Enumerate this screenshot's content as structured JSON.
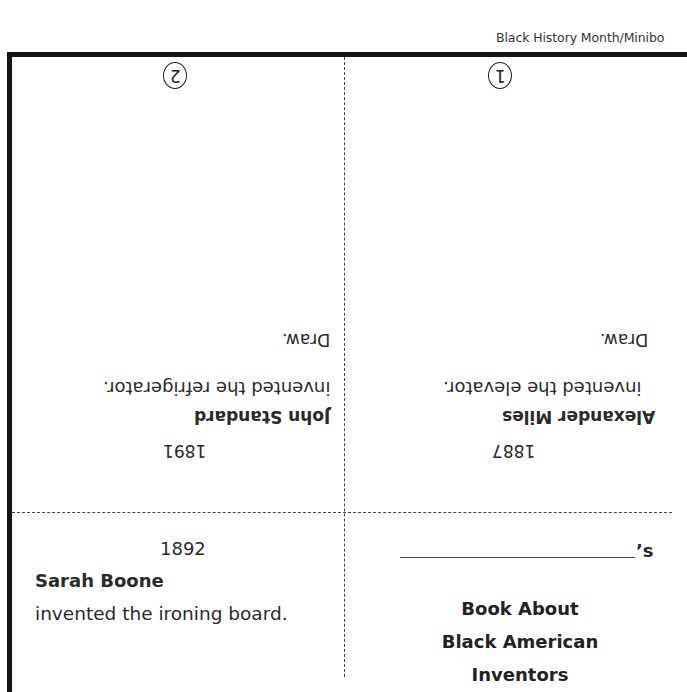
{
  "header": {
    "title": "Black History Month/Minibo"
  },
  "panels": {
    "panel_1": {
      "number": "1",
      "orientation": "upside-down",
      "instruction": "Draw.",
      "description": "invented the elevator.",
      "name": "Alexander Miles",
      "year": "1887"
    },
    "panel_2": {
      "number": "2",
      "orientation": "upside-down",
      "instruction": "Draw.",
      "description": "invented the refrigerator.",
      "name": "John Standard",
      "year": "1891"
    },
    "panel_3": {
      "orientation": "upright",
      "year": "1892",
      "name": "Sarah Boone",
      "description": "invented the ironing board."
    },
    "cover": {
      "orientation": "upright",
      "name_blank_suffix": "’s",
      "title_line_1": "Book About",
      "title_line_2": "Black American",
      "title_line_3": "Inventors"
    }
  },
  "colors": {
    "border": "#151515",
    "text": "#222222",
    "divider": "#444444",
    "background": "#ffffff"
  }
}
